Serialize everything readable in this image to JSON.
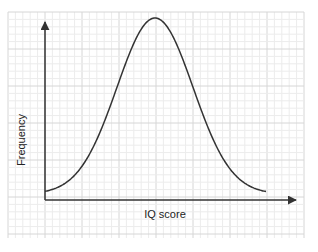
{
  "chart_data": {
    "type": "line",
    "title": "",
    "xlabel": "IQ score",
    "ylabel": "Frequency",
    "grid": true,
    "legend": null,
    "x": [
      0,
      10,
      20,
      30,
      40,
      50,
      60,
      70,
      80,
      90,
      100
    ],
    "values": [
      0.04,
      0.1,
      0.25,
      0.5,
      0.8,
      1.0,
      0.8,
      0.5,
      0.25,
      0.1,
      0.04
    ],
    "ylim": [
      0,
      1.1
    ]
  },
  "colors": {
    "curve": "#333333",
    "axis": "#333333",
    "grid_minor": "#ececec",
    "grid_major": "#d6d6d6"
  },
  "labels": {
    "x_axis": "IQ score",
    "y_axis": "Frequency"
  }
}
